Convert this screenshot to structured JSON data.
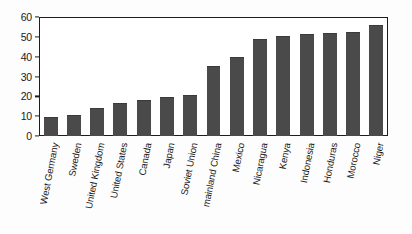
{
  "chart_data": {
    "type": "bar",
    "title": "",
    "subtitle": "",
    "xlabel": "",
    "ylabel": "",
    "ylim": [
      0,
      60
    ],
    "ytick_values": [
      0,
      10,
      20,
      30,
      40,
      50,
      60
    ],
    "ytick_labels": [
      "0",
      "10",
      "20",
      "30",
      "40",
      "50",
      "60"
    ],
    "grid": false,
    "legend": false,
    "legend_position": "none",
    "bar_color": "#4a4a4a",
    "axis_color": "#1d1d1d",
    "background_color": "#ffffff",
    "categories": [
      "West Germany",
      "Sweden",
      "United Kingdom",
      "United States",
      "Canada",
      "Japan",
      "Soviet Union",
      "mainland China",
      "Mexico",
      "Nicaragua",
      "Kenya",
      "Indonesia",
      "Honduras",
      "Morocco",
      "Niger"
    ],
    "values": [
      9,
      10,
      13.5,
      16,
      17.5,
      19,
      20,
      35,
      39.5,
      48.5,
      50,
      51,
      51.5,
      52,
      55.5
    ]
  }
}
